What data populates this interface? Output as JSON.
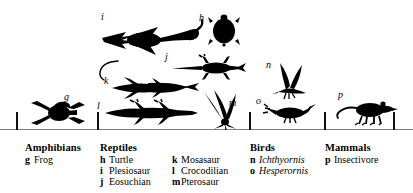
{
  "figure": {
    "ink_color": "#000000",
    "background_color": "#ffffff"
  },
  "silhouettes": [
    {
      "tag": "g",
      "name": "frog-silhouette",
      "label": "Frog"
    },
    {
      "tag": "h",
      "name": "turtle-silhouette",
      "label": "Turtle"
    },
    {
      "tag": "i",
      "name": "plesiosaur-silhouette",
      "label": "Plesiosaur"
    },
    {
      "tag": "j",
      "name": "eosuchian-silhouette",
      "label": "Eosuchian"
    },
    {
      "tag": "k",
      "name": "mosasaur-silhouette",
      "label": "Mosasaur"
    },
    {
      "tag": "l",
      "name": "crocodilian-silhouette",
      "label": "Crocodilian"
    },
    {
      "tag": "m",
      "name": "pterosaur-silhouette",
      "label": "Pterosaur"
    },
    {
      "tag": "n",
      "name": "ichthyornis-silhouette",
      "label": "Ichthyornis"
    },
    {
      "tag": "o",
      "name": "hesperornis-silhouette",
      "label": "Hesperornis"
    },
    {
      "tag": "p",
      "name": "insectivore-silhouette",
      "label": "Insectivore"
    }
  ],
  "brackets": [
    {
      "group": "Amphibians"
    },
    {
      "group": "Reptiles"
    },
    {
      "group": "Birds"
    },
    {
      "group": "Mammals"
    }
  ],
  "legend": {
    "columns": [
      {
        "heading": "Amphibians",
        "entries": [
          {
            "key": "g",
            "name": "Frog",
            "italic": false
          }
        ]
      },
      {
        "heading": "Reptiles",
        "entries": [
          {
            "key": "h",
            "name": "Turtle",
            "italic": false
          },
          {
            "key": "i",
            "name": "Plesiosaur",
            "italic": false
          },
          {
            "key": "j",
            "name": "Eosuchian",
            "italic": false
          }
        ]
      },
      {
        "heading": "",
        "entries": [
          {
            "key": "k",
            "name": "Mosasaur",
            "italic": false
          },
          {
            "key": "l",
            "name": "Crocodilian",
            "italic": false
          },
          {
            "key": "m",
            "name": "Pterosaur",
            "italic": false
          }
        ]
      },
      {
        "heading": "Birds",
        "entries": [
          {
            "key": "n",
            "name": "Ichthyornis",
            "italic": true
          },
          {
            "key": "o",
            "name": "Hesperornis",
            "italic": true
          }
        ]
      },
      {
        "heading": "Mammals",
        "entries": [
          {
            "key": "p",
            "name": "Insectivore",
            "italic": false
          }
        ]
      }
    ]
  }
}
